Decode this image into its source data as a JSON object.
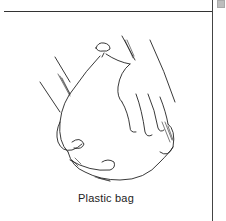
{
  "figure": {
    "caption": "Plastic bag",
    "illustration": "hands-holding-plastic-bag",
    "colors": {
      "ink": "#222222",
      "rule": "#333333",
      "corner_marker": "#bdbdbd"
    }
  }
}
